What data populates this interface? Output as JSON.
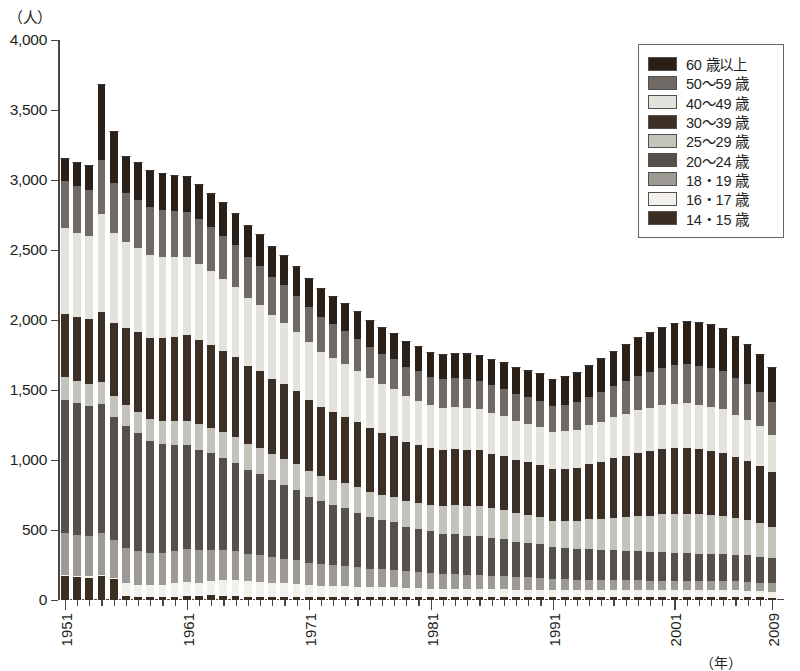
{
  "axes": {
    "y_unit_label": "（人）",
    "x_unit_label": "（年）",
    "y_ticks": [
      "0",
      "500",
      "1,000",
      "1,500",
      "2,000",
      "2,500",
      "3,000",
      "3,500",
      "4,000"
    ],
    "x_major_labels": [
      "1951",
      "1961",
      "1971",
      "1981",
      "1991",
      "2001",
      "2009"
    ]
  },
  "legend": {
    "items": [
      {
        "label": "60 歳以上",
        "color": "#2b2018"
      },
      {
        "label": "50～59 歳",
        "color": "#6f6a66"
      },
      {
        "label": "40～49 歳",
        "color": "#e3e2dc"
      },
      {
        "label": "30～39 歳",
        "color": "#3b2f26"
      },
      {
        "label": "25～29 歳",
        "color": "#c3c2bb"
      },
      {
        "label": "20～24 歳",
        "color": "#55504c"
      },
      {
        "label": "18・19 歳",
        "color": "#9d9a95"
      },
      {
        "label": "16・17 歳",
        "color": "#f2f1eb"
      },
      {
        "label": "14・15 歳",
        "color": "#3a2d22"
      }
    ]
  },
  "chart_data": {
    "type": "bar",
    "stacked": true,
    "title": "",
    "xlabel": "（年）",
    "ylabel": "（人）",
    "ylim": [
      0,
      4000
    ],
    "ytick_step": 500,
    "grid": false,
    "legend_position": "top-right",
    "categories": [
      "1951",
      "1952",
      "1953",
      "1954",
      "1955",
      "1956",
      "1957",
      "1958",
      "1959",
      "1960",
      "1961",
      "1962",
      "1963",
      "1964",
      "1965",
      "1966",
      "1967",
      "1968",
      "1969",
      "1970",
      "1971",
      "1972",
      "1973",
      "1974",
      "1975",
      "1976",
      "1977",
      "1978",
      "1979",
      "1980",
      "1981",
      "1982",
      "1983",
      "1984",
      "1985",
      "1986",
      "1987",
      "1988",
      "1989",
      "1990",
      "1991",
      "1992",
      "1993",
      "1994",
      "1995",
      "1996",
      "1997",
      "1998",
      "1999",
      "2000",
      "2001",
      "2002",
      "2003",
      "2004",
      "2005",
      "2006",
      "2007",
      "2008",
      "2009"
    ],
    "series": [
      {
        "name": "14・15 歳",
        "color": "#3a2d22",
        "values": [
          170,
          165,
          160,
          170,
          150,
          30,
          25,
          25,
          25,
          25,
          30,
          30,
          35,
          30,
          30,
          25,
          25,
          25,
          25,
          25,
          20,
          20,
          20,
          20,
          20,
          20,
          20,
          20,
          20,
          20,
          20,
          20,
          20,
          20,
          20,
          20,
          20,
          20,
          20,
          20,
          18,
          18,
          18,
          18,
          18,
          18,
          18,
          18,
          18,
          18,
          18,
          18,
          18,
          18,
          18,
          18,
          18,
          18,
          15
        ]
      },
      {
        "name": "16・17 歳",
        "color": "#f2f1eb",
        "values": [
          10,
          10,
          10,
          10,
          10,
          90,
          85,
          80,
          85,
          95,
          100,
          95,
          100,
          110,
          115,
          110,
          105,
          100,
          95,
          90,
          85,
          80,
          80,
          80,
          75,
          70,
          70,
          70,
          65,
          65,
          60,
          60,
          60,
          60,
          60,
          60,
          60,
          55,
          55,
          55,
          50,
          50,
          50,
          50,
          50,
          50,
          50,
          50,
          50,
          50,
          50,
          50,
          50,
          50,
          50,
          50,
          48,
          45,
          45
        ]
      },
      {
        "name": "18・19 歳",
        "color": "#9d9a95",
        "values": [
          300,
          290,
          285,
          300,
          270,
          250,
          240,
          230,
          225,
          230,
          235,
          230,
          225,
          215,
          205,
          195,
          190,
          180,
          175,
          170,
          160,
          155,
          150,
          145,
          140,
          135,
          130,
          125,
          120,
          115,
          110,
          105,
          105,
          100,
          100,
          95,
          95,
          90,
          90,
          85,
          80,
          80,
          78,
          78,
          75,
          75,
          72,
          72,
          70,
          70,
          70,
          70,
          68,
          68,
          68,
          65,
          65,
          62,
          60
        ]
      },
      {
        "name": "20～24 歳",
        "color": "#55504c",
        "values": [
          950,
          940,
          930,
          920,
          880,
          870,
          840,
          800,
          780,
          760,
          740,
          720,
          690,
          660,
          630,
          600,
          580,
          550,
          530,
          500,
          470,
          450,
          430,
          410,
          390,
          370,
          350,
          340,
          320,
          310,
          300,
          290,
          285,
          280,
          275,
          265,
          260,
          250,
          245,
          240,
          230,
          225,
          220,
          220,
          215,
          215,
          210,
          210,
          205,
          205,
          200,
          200,
          195,
          195,
          195,
          190,
          190,
          185,
          180
        ]
      },
      {
        "name": "25～29 歳",
        "color": "#c3c2bb",
        "values": [
          160,
          160,
          155,
          155,
          150,
          155,
          155,
          160,
          165,
          170,
          175,
          180,
          180,
          185,
          185,
          185,
          185,
          185,
          185,
          185,
          185,
          180,
          180,
          180,
          180,
          180,
          180,
          180,
          180,
          185,
          190,
          200,
          210,
          215,
          220,
          215,
          210,
          205,
          200,
          195,
          190,
          195,
          200,
          210,
          220,
          230,
          240,
          250,
          260,
          270,
          275,
          280,
          280,
          275,
          270,
          260,
          250,
          240,
          225
        ]
      },
      {
        "name": "30～39 歳",
        "color": "#3b2f26",
        "values": [
          450,
          460,
          470,
          500,
          520,
          550,
          570,
          580,
          590,
          600,
          610,
          600,
          590,
          580,
          570,
          560,
          550,
          540,
          530,
          520,
          510,
          495,
          485,
          475,
          465,
          455,
          445,
          435,
          425,
          415,
          405,
          400,
          400,
          400,
          395,
          390,
          385,
          380,
          375,
          370,
          365,
          370,
          380,
          395,
          410,
          425,
          440,
          450,
          460,
          465,
          470,
          470,
          465,
          460,
          450,
          440,
          425,
          410,
          390
        ]
      },
      {
        "name": "40～49 歳",
        "color": "#e3e2dc",
        "values": [
          620,
          600,
          590,
          700,
          640,
          610,
          600,
          590,
          580,
          570,
          560,
          545,
          530,
          515,
          500,
          485,
          470,
          455,
          440,
          425,
          410,
          395,
          385,
          375,
          365,
          355,
          345,
          335,
          325,
          315,
          305,
          300,
          300,
          300,
          295,
          290,
          285,
          280,
          275,
          270,
          265,
          268,
          272,
          278,
          285,
          292,
          300,
          305,
          310,
          315,
          320,
          320,
          318,
          315,
          310,
          300,
          290,
          280,
          265
        ]
      },
      {
        "name": "50～59 歳",
        "color": "#6f6a66",
        "values": [
          330,
          330,
          330,
          390,
          360,
          350,
          345,
          340,
          335,
          330,
          325,
          320,
          312,
          305,
          298,
          290,
          282,
          275,
          268,
          260,
          252,
          245,
          240,
          235,
          230,
          225,
          220,
          215,
          212,
          208,
          205,
          203,
          203,
          203,
          200,
          198,
          195,
          193,
          190,
          188,
          186,
          190,
          196,
          205,
          215,
          226,
          238,
          248,
          258,
          266,
          274,
          278,
          280,
          278,
          274,
          266,
          256,
          246,
          232
        ]
      },
      {
        "name": "60 歳以上",
        "color": "#2b2018",
        "values": [
          170,
          175,
          175,
          540,
          370,
          270,
          268,
          265,
          262,
          258,
          255,
          250,
          245,
          240,
          235,
          230,
          226,
          222,
          218,
          214,
          210,
          206,
          203,
          200,
          197,
          194,
          191,
          188,
          185,
          182,
          180,
          180,
          182,
          184,
          186,
          188,
          190,
          192,
          194,
          196,
          198,
          206,
          215,
          226,
          238,
          250,
          263,
          273,
          283,
          293,
          302,
          308,
          312,
          312,
          308,
          298,
          286,
          272,
          252
        ]
      }
    ]
  }
}
